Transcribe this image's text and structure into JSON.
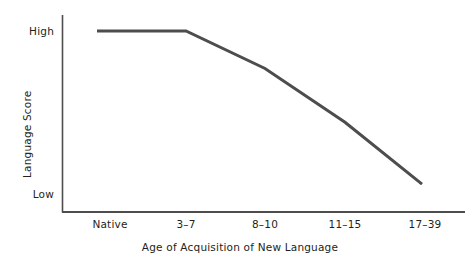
{
  "chart_data": {
    "type": "line",
    "title": "",
    "xlabel": "Age of Acquisition of New Language",
    "ylabel": "Language Score",
    "categories": [
      "Native",
      "3–7",
      "8–10",
      "11–15",
      "17–39"
    ],
    "x_tick_labels": [
      "Native",
      "3–7",
      "8–10",
      "11–15",
      "17–39"
    ],
    "y_tick_labels": [
      "High",
      "Low"
    ],
    "ylim_labels": {
      "top": "High",
      "bottom": "Low"
    },
    "grid": false,
    "legend": null,
    "series": [
      {
        "name": "Language Score",
        "x": [
          "Native",
          "3–7",
          "8–10",
          "11–15",
          "17–39"
        ],
        "values": [
          1.0,
          1.0,
          0.77,
          0.44,
          0.06
        ],
        "value_descriptions": [
          "High",
          "High",
          "Moderately high",
          "Middle-low",
          "Low"
        ],
        "color": "#4d4d4d",
        "line_width": 3,
        "markers": false
      }
    ],
    "axis_color": "#4d4d4d",
    "background_color": "#ffffff",
    "text_color": "#231f20"
  },
  "geometry": {
    "y_axis_x": 62,
    "y_axis_top": 15,
    "y_axis_bottom": 212,
    "x_axis_y": 212,
    "x_axis_left": 62,
    "x_axis_right": 465,
    "tick_x_positions": [
      110,
      186,
      265,
      345,
      425
    ],
    "high_y": 31,
    "low_y": 194,
    "line_points": "97,31 186,31 265,72 345,132 422,201"
  }
}
